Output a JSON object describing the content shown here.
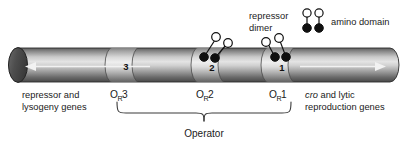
{
  "figure": {
    "background": "#ffffff",
    "width": 412,
    "height": 145
  },
  "legend": {
    "repressor_label_line1": "repressor",
    "repressor_label_line2": "dimer",
    "amino_label": "amino domain",
    "amino_circle_color": "#ffffff",
    "carboxyl_circle_color": "#101010",
    "stroke_color": "#101010"
  },
  "dna": {
    "left_arrow_label": "leftward-transcription-arrow",
    "right_arrow_label": "rightward-transcription-arrow",
    "body_color_light": "#d8d8d8",
    "body_color_dark": "#3c3c3c",
    "cap_color": "#4a4a4a"
  },
  "genes": {
    "left_line1": "repressor and",
    "left_line2": "lysogeny genes",
    "right_italic": "cro",
    "right_rest": " and lytic",
    "right_line2": "reproduction genes"
  },
  "sites": [
    {
      "number": "3",
      "label_base": "O",
      "label_sub": "R",
      "label_num": "3",
      "occupied": "false"
    },
    {
      "number": "2",
      "label_base": "O",
      "label_sub": "R",
      "label_num": "2",
      "occupied": "true"
    },
    {
      "number": "1",
      "label_base": "O",
      "label_sub": "R",
      "label_num": "1",
      "occupied": "true"
    }
  ],
  "operator": {
    "bracket_label": "Operator"
  }
}
